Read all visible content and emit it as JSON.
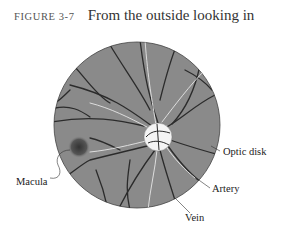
{
  "caption": {
    "figure_number": "FIGURE 3-7",
    "title": "From the outside looking in"
  },
  "diagram": {
    "colors": {
      "retina_fill": "#8a8a8a",
      "vessel_dark": "#2b2b2b",
      "vessel_light": "#e6e6e6",
      "optic_disk": "#f4f4f4",
      "macula": "#444444"
    },
    "labels": [
      {
        "id": "optic-disk",
        "text": "Optic disk"
      },
      {
        "id": "macula",
        "text": "Macula"
      },
      {
        "id": "artery",
        "text": "Artery"
      },
      {
        "id": "vein",
        "text": "Vein"
      }
    ]
  }
}
